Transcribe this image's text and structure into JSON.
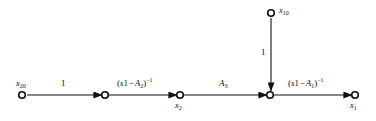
{
  "diagram": {
    "type": "signal-flow-graph",
    "title": "",
    "background_color": "#ffffff",
    "stroke_color": "#111111",
    "nodes": [
      {
        "id": "n-x20",
        "label_main": "x",
        "label_sub": "20",
        "hat": false,
        "x": 22,
        "y": 95,
        "label_pos": "above-left"
      },
      {
        "id": "n-mid1",
        "label_main": "",
        "label_sub": "",
        "hat": false,
        "x": 105,
        "y": 95,
        "label_pos": "none"
      },
      {
        "id": "n-x2hat",
        "label_main": "x",
        "label_sub": "2",
        "hat": true,
        "x": 180,
        "y": 95,
        "label_pos": "below"
      },
      {
        "id": "n-junction",
        "label_main": "",
        "label_sub": "",
        "hat": false,
        "x": 270,
        "y": 95,
        "label_pos": "none"
      },
      {
        "id": "n-x1hat",
        "label_main": "x",
        "label_sub": "1",
        "hat": true,
        "x": 355,
        "y": 95,
        "label_pos": "below"
      },
      {
        "id": "n-x10",
        "label_main": "x",
        "label_sub": "10",
        "hat": false,
        "x": 271,
        "y": 13,
        "label_pos": "right"
      }
    ],
    "edges": [
      {
        "id": "e-1",
        "from": "n-x20",
        "to": "n-mid1",
        "orientation": "horizontal",
        "gain_text": "1"
      },
      {
        "id": "e-2",
        "from": "n-mid1",
        "to": "n-x2hat",
        "orientation": "horizontal",
        "gain_text": "(s1 - A2)^-1"
      },
      {
        "id": "e-3",
        "from": "n-x2hat",
        "to": "n-junction",
        "orientation": "horizontal",
        "gain_text": "A3"
      },
      {
        "id": "e-4",
        "from": "n-junction",
        "to": "n-x1hat",
        "orientation": "horizontal",
        "gain_text": "(s1 - A1)^-1"
      },
      {
        "id": "e-5",
        "from": "n-x10",
        "to": "n-junction",
        "orientation": "vertical",
        "gain_text": "1"
      }
    ],
    "labels": {
      "gain_1_first": "1",
      "gain_sI_minus_A2_inv": {
        "open": "(",
        "s": "s",
        "one": "1",
        "minus": "−",
        "a": "A",
        "a_sub": "2",
        "close": ")",
        "exp": "−1"
      },
      "gain_A3": {
        "a": "A",
        "a_sub": "3"
      },
      "gain_sI_minus_A1_inv": {
        "open": "(",
        "s": "s",
        "one": "1",
        "minus": "−",
        "a": "A",
        "a_sub": "1",
        "close": ")",
        "exp": "−1"
      },
      "gain_1_vertical": "1",
      "node_x20": {
        "main": "x",
        "sub": "20"
      },
      "node_x10": {
        "main": "x",
        "sub": "10"
      },
      "node_x2_hat": {
        "main": "x",
        "sub": "2",
        "hat": "ˆ"
      },
      "node_x1_hat": {
        "main": "x",
        "sub": "1",
        "hat": "ˆ"
      }
    }
  }
}
